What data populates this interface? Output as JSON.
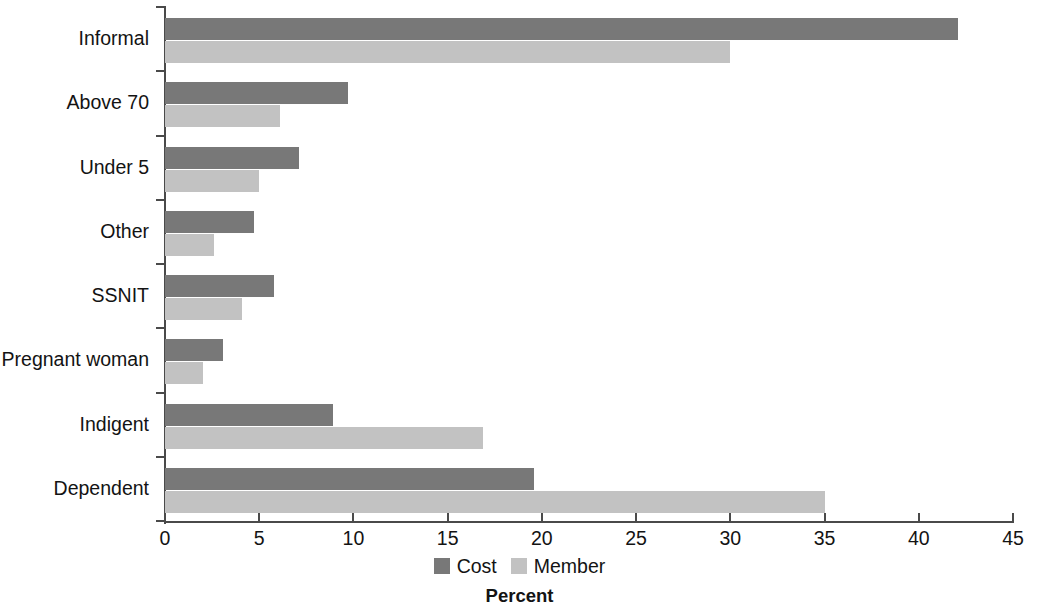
{
  "chart_data": {
    "type": "bar",
    "orientation": "horizontal",
    "title": "",
    "xlabel": "Percent",
    "ylabel": "",
    "xlim": [
      0,
      45
    ],
    "xticks": [
      0,
      5,
      10,
      15,
      20,
      25,
      30,
      35,
      40,
      45
    ],
    "xtick_labels": [
      "0",
      "5",
      "10",
      "15",
      "20",
      "25",
      "30",
      "35",
      "40",
      "45"
    ],
    "grid": false,
    "legend_position": "bottom",
    "categories": [
      "Informal",
      "Above 70",
      "Under 5",
      "Other",
      "SSNIT",
      "Pregnant woman",
      "Indigent",
      "Dependent"
    ],
    "series": [
      {
        "name": "Cost",
        "color": "#787878",
        "values": [
          42.1,
          9.7,
          7.1,
          4.7,
          5.8,
          3.1,
          8.9,
          19.6
        ]
      },
      {
        "name": "Member",
        "color": "#c2c2c2",
        "values": [
          30.0,
          6.1,
          5.0,
          2.6,
          4.1,
          2.0,
          16.9,
          35.0
        ]
      }
    ]
  }
}
